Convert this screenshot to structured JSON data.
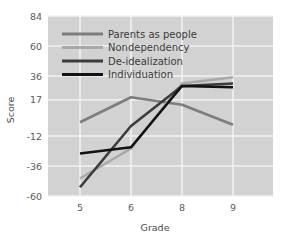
{
  "chart_data": {
    "type": "line",
    "title": "",
    "xlabel": "Grade",
    "ylabel": "Score",
    "categories": [
      "5",
      "6",
      "8",
      "9"
    ],
    "x": [
      5,
      6,
      8,
      9
    ],
    "xtick_labels": [
      "5",
      "6",
      "8",
      "9"
    ],
    "ytick_labels": [
      "84",
      "60",
      "36",
      "17",
      "-12",
      "-36",
      "-60"
    ],
    "ytick_values": [
      84,
      60,
      36,
      17,
      -12,
      -36,
      -60
    ],
    "ylim": [
      -60,
      84
    ],
    "grid": true,
    "legend_position": "upper-left-inside",
    "plot_background": "#d2d2d2",
    "gridline_color": "#f2f2f2",
    "series": [
      {
        "name": "Parents as people",
        "color": "#7d7d7d",
        "values": [
          -1,
          19,
          13,
          -3
        ]
      },
      {
        "name": "Nondependency",
        "color": "#a8a8a8",
        "values": [
          -46,
          -22,
          30,
          35
        ]
      },
      {
        "name": "De-idealization",
        "color": "#3c3c3c",
        "values": [
          -53,
          -4,
          28,
          30
        ]
      },
      {
        "name": "Individuation",
        "color": "#121212",
        "values": [
          -26,
          -21,
          28,
          27
        ]
      }
    ]
  },
  "legend": {
    "items": [
      {
        "label": "Parents as people"
      },
      {
        "label": "Nondependency"
      },
      {
        "label": "De-idealization"
      },
      {
        "label": "Individuation"
      }
    ]
  },
  "axes": {
    "y_title": "Score",
    "x_title": "Grade"
  }
}
